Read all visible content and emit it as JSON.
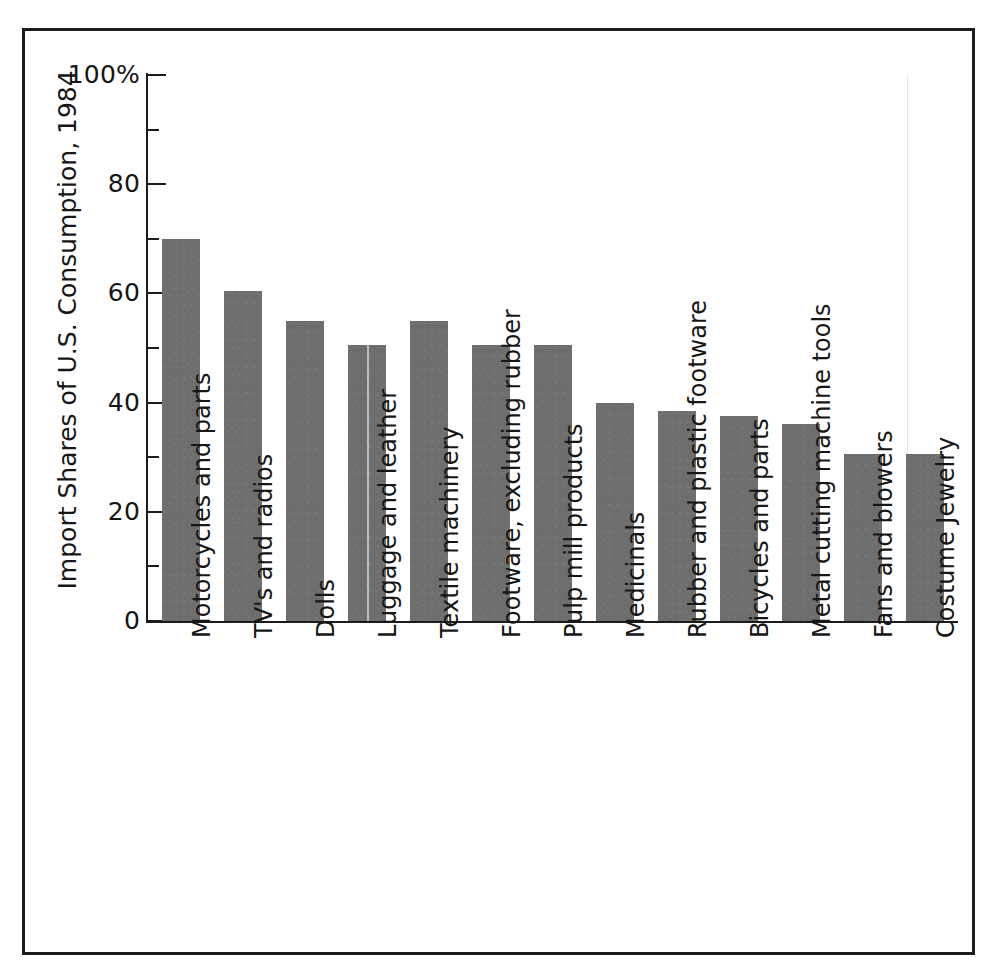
{
  "chart_data": {
    "type": "bar",
    "title": "",
    "xlabel": "",
    "ylabel": "Import Shares of U.S. Consumption, 1984",
    "ylim": [
      0,
      100
    ],
    "y_unit": "%",
    "grid": false,
    "legend": "none",
    "y_major_ticks": [
      0,
      20,
      40,
      60,
      80,
      100
    ],
    "y_minor_ticks": [
      10,
      30,
      50,
      70,
      90
    ],
    "y_tick_labels": [
      "0",
      "20",
      "40",
      "60",
      "80",
      "100%"
    ],
    "bar_color": "#6e6e6e",
    "axis_color": "#1b1b1b",
    "categories": [
      "Motorcycles and parts",
      "TV's and radios",
      "Dolls",
      "Luggage and leather",
      "Textile machinery",
      "Footware, excluding rubber",
      "Pulp mill products",
      "Medicinals",
      "Rubber and plastic footware",
      "Bicycles and parts",
      "Metal cutting machine tools",
      "Fans and blowers",
      "Costume Jewelry"
    ],
    "values": [
      70,
      60.5,
      55,
      50.5,
      55,
      50.5,
      50.5,
      40,
      38.5,
      37.5,
      36,
      30.5,
      30.5
    ]
  },
  "axis": {
    "y_title": "Import Shares of U.S. Consumption, 1984"
  }
}
